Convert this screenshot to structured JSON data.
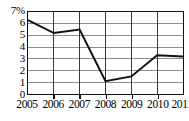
{
  "chart_data": {
    "type": "line",
    "title": "",
    "subtitle": "",
    "xlabel": "",
    "ylabel": "",
    "unit": "%",
    "categories": [
      "2005",
      "2006",
      "2007",
      "2008",
      "2009",
      "2010",
      "2011"
    ],
    "x": [
      2005,
      2006,
      2007,
      2008,
      2009,
      2010,
      2011
    ],
    "values": [
      6.3,
      5.2,
      5.5,
      1.1,
      1.5,
      3.3,
      3.2
    ],
    "series": [
      {
        "name": "",
        "values": [
          6.3,
          5.2,
          5.5,
          1.1,
          1.5,
          3.3,
          3.2
        ]
      }
    ],
    "ylim": [
      0,
      7
    ],
    "xlim": [
      2005,
      2011
    ],
    "y_ticks": [
      0,
      1,
      2,
      3,
      4,
      5,
      6,
      7
    ],
    "y_tick_labels": [
      "0",
      "1",
      "2",
      "3",
      "4",
      "5",
      "6",
      "7%"
    ],
    "x_ticks": [
      2005,
      2006,
      2007,
      2008,
      2009,
      2010,
      2011
    ],
    "x_tick_labels": [
      "2005",
      "2006",
      "2007",
      "2008",
      "2009",
      "2010",
      "2011"
    ],
    "grid": true,
    "grid_horizontal": true,
    "grid_vertical": true,
    "legend": false,
    "legend_position": "none",
    "line_color": "#111111",
    "grid_color": "#8a8a8a",
    "axis_color": "#111111",
    "background_color": "#ffffff",
    "annotations": []
  }
}
